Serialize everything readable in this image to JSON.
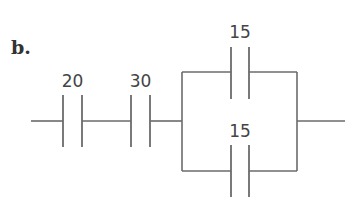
{
  "problem_label": "b.",
  "diagram": {
    "type": "capacitor network",
    "units": "unlabeled",
    "series": [
      {
        "id": "C1",
        "value": "20"
      },
      {
        "id": "C2",
        "value": "30"
      }
    ],
    "parallel": [
      {
        "id": "C3",
        "value": "15",
        "branch": "top"
      },
      {
        "id": "C4",
        "value": "15",
        "branch": "bottom"
      }
    ]
  },
  "labels": {
    "c1": "20",
    "c2": "30",
    "c3": "15",
    "c4": "15"
  },
  "colors": {
    "line": "#6b6b6b",
    "text": "#444444"
  }
}
